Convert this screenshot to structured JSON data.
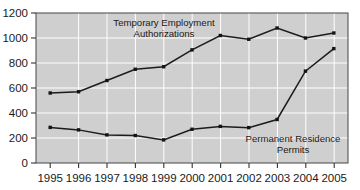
{
  "chart_data": {
    "type": "line",
    "title": "",
    "xlabel": "",
    "ylabel": "",
    "ylim": [
      0,
      1200
    ],
    "ytick_values": [
      0,
      200,
      400,
      600,
      800,
      1000,
      1200
    ],
    "ytick_labels": [
      "0",
      "200",
      "400",
      "600",
      "800",
      "1000",
      "1200"
    ],
    "grid": true,
    "grid_color": "#ffffff",
    "plot_background": "#cfcfcf",
    "line_color": "#1c1c1c",
    "legend_position": "inline-annotations",
    "categories": [
      "1995",
      "1996",
      "1997",
      "1998",
      "1999",
      "2000",
      "2001",
      "2002",
      "2003",
      "2004",
      "2005"
    ],
    "x": [
      1995,
      1996,
      1997,
      1998,
      1999,
      2000,
      2001,
      2002,
      2003,
      2004,
      2005
    ],
    "series": [
      {
        "name": "Temporary Employment Authorizations",
        "label_line1": "Temporary Employment",
        "label_line2": "Authorizations",
        "values": [
          560,
          570,
          660,
          750,
          770,
          905,
          1020,
          990,
          1080,
          1000,
          1040
        ]
      },
      {
        "name": "Permanent Residence Permits",
        "label_line1": "Permanent Residence",
        "label_line2": "Permits",
        "values": [
          285,
          265,
          225,
          220,
          185,
          270,
          293,
          283,
          348,
          735,
          915
        ]
      }
    ]
  },
  "axis": {
    "y_labels": [
      "1200",
      "1000",
      "800",
      "600",
      "400",
      "200",
      "0"
    ],
    "x_labels": [
      "1995",
      "1996",
      "1997",
      "1998",
      "1999",
      "2000",
      "2001",
      "2002",
      "2003",
      "2004",
      "2005"
    ]
  },
  "annotations": {
    "upper": {
      "line1": "Temporary Employment",
      "line2": "Authorizations"
    },
    "lower": {
      "line1": "Permanent Residence",
      "line2": "Permits"
    }
  }
}
